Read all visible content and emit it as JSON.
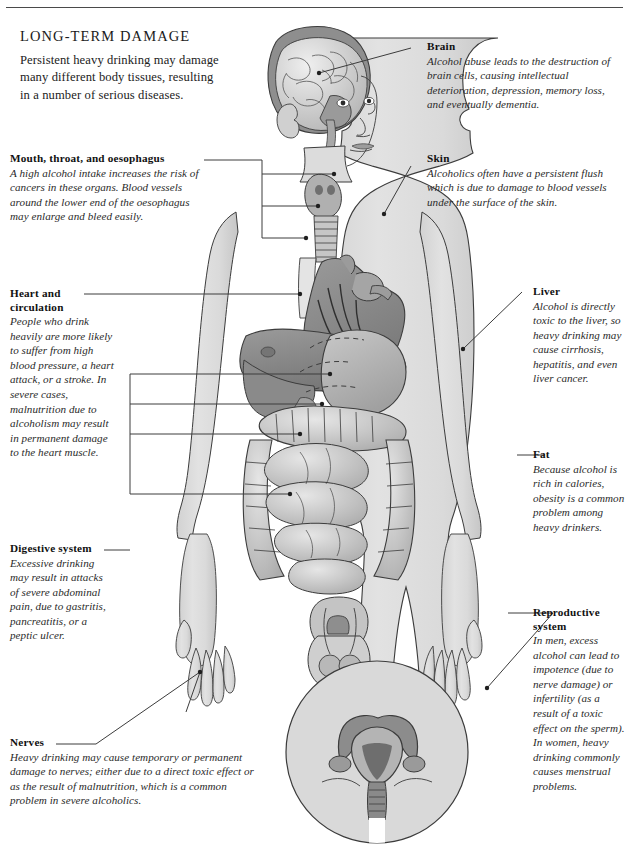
{
  "page": {
    "title": "LONG-TERM DAMAGE",
    "intro": "Persistent heavy drinking may damage many different body tissues, resulting in a number of serious diseases.",
    "figure_description": "Anatomical illustration of a standing human body in light grey silhouette with internal organs exposed: cutaway head showing the brain, larynx and trachea, heart and major vessels, liver, stomach, transverse colon and coiled small intestine, male reproductive organs, and a circular inset of the female uterus, ovaries and fallopian tubes."
  },
  "colors": {
    "page_background": "#ffffff",
    "body_silhouette": "#dedede",
    "outline": "#3c3c3c",
    "organ_dark": "#8b8b8b",
    "organ_mid": "#b3b3b3",
    "organ_light": "#d2d2d2",
    "text": "#1b1b1b",
    "leader_line": "#3c3c3c"
  },
  "callouts": [
    {
      "id": "brain",
      "title": "Brain",
      "body": "Alcohol abuse leads to the destruction of brain cells, causing intellectual deterioration, depression, memory loss, and eventually dementia.",
      "side": "right"
    },
    {
      "id": "skin",
      "title": "Skin",
      "body": "Alcoholics often have a persistent flush which is due to damage to blood vessels under the surface of the skin.",
      "side": "right"
    },
    {
      "id": "liver",
      "title": "Liver",
      "body": "Alcohol is directly toxic to the liver, so heavy drinking may cause cirrhosis, hepatitis, and even liver cancer.",
      "side": "right"
    },
    {
      "id": "fat",
      "title": "Fat",
      "body": "Because alcohol is rich in calories, obesity is a common problem among heavy drinkers.",
      "side": "right"
    },
    {
      "id": "reproductive-system",
      "title": "Reproductive system",
      "body": "In men, excess alcohol can lead to impotence (due to nerve damage) or infertility (as a result of a toxic effect on the sperm). In women, heavy drinking commonly causes menstrual problems.",
      "side": "right"
    },
    {
      "id": "mouth-throat-oesophagus",
      "title": "Mouth, throat, and oesophagus",
      "body": "A high alcohol intake increases the risk of cancers in these organs. Blood vessels around the lower end of the oesophagus may enlarge and bleed easily.",
      "side": "left"
    },
    {
      "id": "heart-and-circulation",
      "title": "Heart and circulation",
      "body": "People who drink heavily are more likely to suffer from high blood pressure, a heart attack, or a stroke. In severe cases, malnutrition due to alcoholism may result in permanent damage to the heart muscle.",
      "side": "left"
    },
    {
      "id": "digestive-system",
      "title": "Digestive system",
      "body": "Excessive drinking may result in attacks of severe abdominal pain, due to gastritis, pancreatitis, or a peptic ulcer.",
      "side": "left"
    },
    {
      "id": "nerves",
      "title": "Nerves",
      "body": "Heavy drinking may cause temporary or permanent damage to nerves; either due to a direct toxic effect or as the result of malnutrition, which is a common problem in severe alcoholics.",
      "side": "left"
    }
  ]
}
